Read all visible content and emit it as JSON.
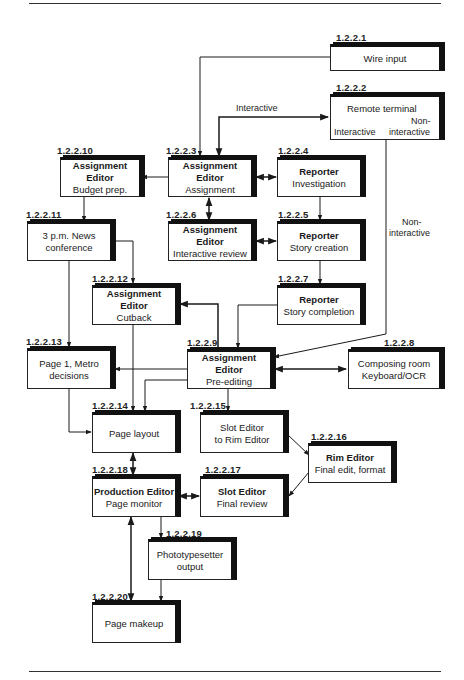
{
  "diagram": {
    "nodes": [
      {
        "id": "1.2.2.1",
        "title": "",
        "subtitle": "",
        "text": "Wire input"
      },
      {
        "id": "1.2.2.2",
        "title": "",
        "subtitle": "",
        "text": "Remote terminal",
        "inner_left": "Interactive",
        "inner_right_1": "Non-",
        "inner_right_2": "interactive"
      },
      {
        "id": "1.2.2.3",
        "title": "Assignment Editor",
        "subtitle": "Assignment"
      },
      {
        "id": "1.2.2.4",
        "title": "Reporter",
        "subtitle": "Investigation"
      },
      {
        "id": "1.2.2.5",
        "title": "Reporter",
        "subtitle": "Story creation"
      },
      {
        "id": "1.2.2.6",
        "title": "Assignment Editor",
        "subtitle": "Interactive review"
      },
      {
        "id": "1.2.2.7",
        "title": "Reporter",
        "subtitle": "Story completion"
      },
      {
        "id": "1.2.2.8",
        "title": "",
        "subtitle": "",
        "line1": "Composing room",
        "line2": "Keyboard/OCR"
      },
      {
        "id": "1.2.2.9",
        "title": "Assignment Editor",
        "subtitle": "Pre-editing"
      },
      {
        "id": "1.2.2.10",
        "title": "Assignment Editor",
        "subtitle": "Budget prep."
      },
      {
        "id": "1.2.2.11",
        "title": "",
        "subtitle": "",
        "line1": "3 p.m. News",
        "line2": "conference"
      },
      {
        "id": "1.2.2.12",
        "title": "Assignment Editor",
        "subtitle": "Cutback"
      },
      {
        "id": "1.2.2.13",
        "title": "",
        "subtitle": "",
        "line1": "Page 1, Metro",
        "line2": "decisions"
      },
      {
        "id": "1.2.2.14",
        "title": "",
        "subtitle": "",
        "text": "Page layout"
      },
      {
        "id": "1.2.2.15",
        "title": "",
        "subtitle": "",
        "line1": "Slot Editor",
        "line2": "to Rim Editor"
      },
      {
        "id": "1.2.2.16",
        "title": "Rim Editor",
        "subtitle": "Final edit, format"
      },
      {
        "id": "1.2.2.17",
        "title": "Slot Editor",
        "subtitle": "Final review"
      },
      {
        "id": "1.2.2.18",
        "title": "Production Editor",
        "subtitle": "Page monitor"
      },
      {
        "id": "1.2.2.19",
        "title": "",
        "subtitle": "",
        "line1": "Phototypesetter",
        "line2": "output"
      },
      {
        "id": "1.2.2.20",
        "title": "",
        "subtitle": "",
        "text": "Page makeup"
      }
    ],
    "edge_labels": {
      "interactive": "Interactive",
      "non_interactive_1": "Non-",
      "non_interactive_2": "interactive"
    },
    "colors": {
      "line": "#1a1a1a",
      "background": "#ffffff"
    }
  }
}
